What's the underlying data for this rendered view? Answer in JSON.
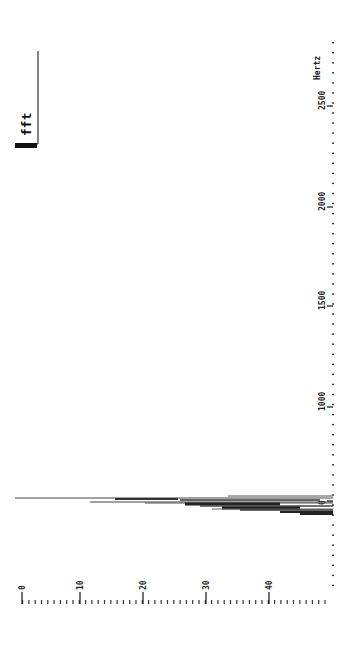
{
  "chart_data": {
    "type": "line",
    "title": "",
    "orientation": "rotated-90-clockwise",
    "xlabel": "Hertz",
    "ylabel": "",
    "x_ticks": [
      0,
      500,
      1000,
      1500,
      2000,
      2500
    ],
    "x_tick_labels": [
      "0",
      "500",
      "1000",
      "1500",
      "2000",
      "2500"
    ],
    "x_range": [
      -450,
      2300
    ],
    "y_ticks": [
      0,
      10,
      20,
      30,
      40
    ],
    "y_tick_labels": [
      "0",
      "10",
      "20",
      "30",
      "40"
    ],
    "y_range": [
      0,
      50
    ],
    "legend": [
      {
        "name": "fft",
        "position": "top-left"
      }
    ],
    "series": [
      {
        "name": "fft",
        "description": "Spectral spikes clustered near 0 Hz; values measured from baseline (~50) toward axis (0).",
        "points": [
          {
            "hz": 5,
            "value": 0.0
          },
          {
            "hz": 0,
            "value": 33
          },
          {
            "hz": -20,
            "value": 12
          },
          {
            "hz": -25,
            "value": 20
          },
          {
            "hz": -35,
            "value": 26
          },
          {
            "hz": -45,
            "value": 29
          },
          {
            "hz": -55,
            "value": 35
          },
          {
            "hz": -65,
            "value": 41
          },
          {
            "hz": -75,
            "value": 44
          }
        ]
      }
    ],
    "grid": false
  },
  "legend": {
    "label": "fft"
  },
  "axes": {
    "hertz_label": "Hertz",
    "hertz_ticks": [
      {
        "label": "2500",
        "y": 102
      },
      {
        "label": "2000",
        "y": 203
      },
      {
        "label": "1500",
        "y": 302
      },
      {
        "label": "1000",
        "y": 403
      },
      {
        "label": "0",
        "y": 497
      }
    ],
    "value_ticks": [
      {
        "label": "0",
        "x": 22
      },
      {
        "label": "10",
        "x": 80
      },
      {
        "label": "20",
        "x": 143
      },
      {
        "label": "30",
        "x": 206
      },
      {
        "label": "40",
        "x": 269
      }
    ]
  },
  "spikes": [
    {
      "y": 496,
      "x1": 228,
      "x2": 333,
      "w": 1.2,
      "c": "#555"
    },
    {
      "y": 498,
      "x1": 15,
      "x2": 333,
      "w": 1.2,
      "c": "#444"
    },
    {
      "y": 499,
      "x1": 115,
      "x2": 178,
      "w": 2.2,
      "c": "#333"
    },
    {
      "y": 500,
      "x1": 180,
      "x2": 320,
      "w": 1.5,
      "c": "#333"
    },
    {
      "y": 502,
      "x1": 90,
      "x2": 333,
      "w": 1.2,
      "c": "#444"
    },
    {
      "y": 503,
      "x1": 145,
      "x2": 333,
      "w": 1.2,
      "c": "#555"
    },
    {
      "y": 504,
      "x1": 185,
      "x2": 280,
      "w": 3.0,
      "c": "#222"
    },
    {
      "y": 506,
      "x1": 200,
      "x2": 333,
      "w": 1.5,
      "c": "#444"
    },
    {
      "y": 508,
      "x1": 222,
      "x2": 300,
      "w": 3.2,
      "c": "#1a1a1a"
    },
    {
      "y": 509,
      "x1": 212,
      "x2": 333,
      "w": 1.0,
      "c": "#666"
    },
    {
      "y": 510,
      "x1": 240,
      "x2": 333,
      "w": 1.5,
      "c": "#333"
    },
    {
      "y": 512,
      "x1": 280,
      "x2": 333,
      "w": 2.0,
      "c": "#222"
    },
    {
      "y": 514,
      "x1": 300,
      "x2": 333,
      "w": 2.0,
      "c": "#222"
    }
  ]
}
